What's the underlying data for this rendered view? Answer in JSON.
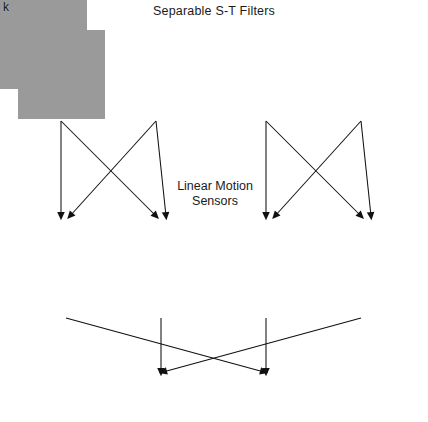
{
  "figure": {
    "title": "Separable S-T Filters",
    "middle_label_line1": "Linear Motion",
    "middle_label_line2": "Sensors",
    "square_label": "(^2)",
    "plus": "+",
    "minus": "-",
    "background_color": "#ffffff",
    "panel_mean_color": "#9a9a9a",
    "ink_color": "#111111"
  },
  "top_row": {
    "row_name": "separable-spatiotemporal-filters",
    "panels": [
      {
        "id": "c",
        "label": "c",
        "x": 18,
        "y": 30,
        "w": 87,
        "h": 89,
        "desc": "even-symmetric spatial, non-directional temporal: bright center blob below, dark bar above",
        "spatial_phase": 0,
        "temporal_phase": 0,
        "sf": 2.1,
        "tf": 1.15,
        "sigma_x": 0.26,
        "sigma_t": 0.3,
        "polarity": 1
      },
      {
        "id": "d",
        "label": "d",
        "x": 113,
        "y": 30,
        "w": 87,
        "h": 89,
        "desc": "odd-symmetric spatial: dark blob left of bright blob, bright bar above",
        "spatial_phase": 1.5708,
        "temporal_phase": 0,
        "sf": 2.1,
        "tf": 1.15,
        "sigma_x": 0.26,
        "sigma_t": 0.3,
        "polarity": 1
      },
      {
        "id": "e",
        "label": "e",
        "x": 223,
        "y": 30,
        "w": 87,
        "h": 89,
        "desc": "even-symmetric spatial, mirrored temporal profile",
        "spatial_phase": 0,
        "temporal_phase": 0,
        "sf": 2.1,
        "tf": 1.15,
        "sigma_x": 0.26,
        "sigma_t": 0.3,
        "polarity": 1
      },
      {
        "id": "f",
        "label": "f",
        "x": 318,
        "y": 30,
        "w": 87,
        "h": 89,
        "desc": "odd-symmetric spatial mirrored: bright blob left of dark blob",
        "spatial_phase": -1.5708,
        "temporal_phase": 0,
        "sf": 2.1,
        "tf": 1.15,
        "sigma_x": 0.26,
        "sigma_t": 0.3,
        "polarity": 1
      }
    ]
  },
  "bottom_row": {
    "row_name": "linear-motion-sensors",
    "panels": [
      {
        "id": "g",
        "label": "g",
        "x": 18,
        "y": 226,
        "w": 87,
        "h": 89,
        "desc": "oriented space-time filter tilted rightward (leftward motion selective)",
        "spatial_phase": 0,
        "tilt": 0.62,
        "sf": 1.9,
        "sigma_x": 0.3,
        "sigma_t": 0.42,
        "polarity": 1
      },
      {
        "id": "h",
        "label": "h",
        "x": 113,
        "y": 226,
        "w": 87,
        "h": 89,
        "desc": "oriented space-time filter tilted rightward, quadrature phase",
        "spatial_phase": 1.5708,
        "tilt": 0.62,
        "sf": 1.9,
        "sigma_x": 0.3,
        "sigma_t": 0.42,
        "polarity": 1
      },
      {
        "id": "j",
        "label": "j",
        "x": 223,
        "y": 226,
        "w": 87,
        "h": 89,
        "desc": "oriented space-time filter tilted leftward (rightward motion selective)",
        "spatial_phase": 0,
        "tilt": -0.62,
        "sf": 1.9,
        "sigma_x": 0.3,
        "sigma_t": 0.42,
        "polarity": 1
      },
      {
        "id": "k",
        "label": "k",
        "x": 318,
        "y": 226,
        "w": 87,
        "h": 89,
        "desc": "oriented space-time filter tilted leftward, quadrature phase",
        "spatial_phase": -1.5708,
        "tilt": -0.62,
        "sf": 1.9,
        "sigma_x": 0.3,
        "sigma_t": 0.42,
        "polarity": 1
      }
    ]
  },
  "combination_signs": [
    {
      "name": "sign-g-left",
      "text": "-",
      "x": 44,
      "y": 185
    },
    {
      "name": "sign-g-right",
      "text": "+",
      "x": 75,
      "y": 185
    },
    {
      "name": "sign-h-left",
      "text": "+",
      "x": 137,
      "y": 185
    },
    {
      "name": "sign-h-right",
      "text": "+",
      "x": 170,
      "y": 185
    },
    {
      "name": "sign-j-left",
      "text": "+",
      "x": 249,
      "y": 185
    },
    {
      "name": "sign-j-right",
      "text": "-",
      "x": 280,
      "y": 185
    },
    {
      "name": "sign-k-left",
      "text": "+",
      "x": 341,
      "y": 185
    },
    {
      "name": "sign-k-right",
      "text": "+",
      "x": 375,
      "y": 185
    }
  ],
  "square_labels": [
    {
      "name": "square-label-g",
      "text": "(^2)",
      "x": 60,
      "y": 337
    },
    {
      "name": "square-label-h",
      "text": "(^2)",
      "x": 158,
      "y": 330
    },
    {
      "name": "square-label-j",
      "text": "(^2)",
      "x": 243,
      "y": 330
    },
    {
      "name": "square-label-k",
      "text": "(^2)",
      "x": 327,
      "y": 337
    }
  ],
  "output_signs": [
    {
      "name": "output-plus-left",
      "text": "+",
      "x": 158,
      "y": 390
    },
    {
      "name": "output-plus-right",
      "text": "+",
      "x": 262,
      "y": 390
    }
  ]
}
